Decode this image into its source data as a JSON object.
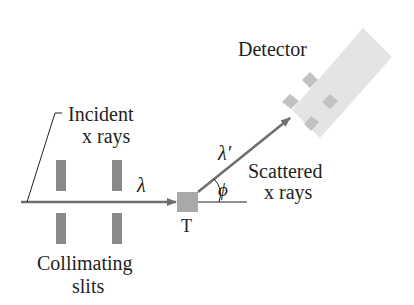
{
  "labels": {
    "detector": "Detector",
    "incident_line1": "Incident",
    "incident_line2": "x rays",
    "collimating_line1": "Collimating",
    "collimating_line2": "slits",
    "scattered_line1": "Scattered",
    "scattered_line2": "x rays",
    "target": "T",
    "lambda": "λ",
    "lambda_prime": "λ′",
    "phi": "ϕ"
  },
  "colors": {
    "beam": "#6e6e6e",
    "slit": "#8a8a8a",
    "target": "#a9a9a9",
    "detector": "#e4e4e4",
    "detector_pad": "#c2c2c2",
    "text": "#231f20"
  }
}
